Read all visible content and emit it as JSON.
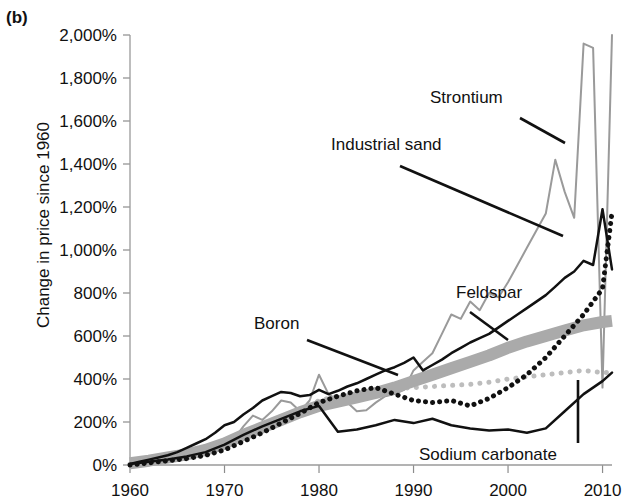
{
  "panel": {
    "label": "(b)"
  },
  "chart_data": {
    "type": "line",
    "title": "",
    "subtitle": "",
    "xlabel": "",
    "ylabel": "Change in price since 1960",
    "xlim": [
      1960,
      2011
    ],
    "ylim": [
      0,
      2000
    ],
    "xticks": [
      1960,
      1970,
      1980,
      1990,
      2000,
      2010
    ],
    "xtick_labels": [
      "1960",
      "1970",
      "1980",
      "1990",
      "2000",
      "2010"
    ],
    "yticks": [
      0,
      200,
      400,
      600,
      800,
      1000,
      1200,
      1400,
      1600,
      1800,
      2000
    ],
    "ytick_labels": [
      "0%",
      "200%",
      "400%",
      "600%",
      "800%",
      "1,000%",
      "1,200%",
      "1,400%",
      "1,600%",
      "1,800%",
      "2,000%"
    ],
    "grid": false,
    "legend": "inline-annotations",
    "units": "percent change since 1960",
    "annotations": [
      {
        "name": "strontium-annotation",
        "text": "Strontium",
        "text_x": 430,
        "text_y": 103,
        "leader": [
          [
            520,
            118
          ],
          [
            565,
            143
          ]
        ]
      },
      {
        "name": "industrial-sand-annotation",
        "text": "Industrial sand",
        "text_x": 331,
        "text_y": 150,
        "leader": [
          [
            563,
            236
          ],
          [
            400,
            166
          ]
        ]
      },
      {
        "name": "feldspar-annotation",
        "text": "Feldspar",
        "text_x": 456,
        "text_y": 298,
        "leader": [
          [
            508,
            340
          ],
          [
            470,
            312
          ]
        ]
      },
      {
        "name": "boron-annotation",
        "text": "Boron",
        "text_x": 254,
        "text_y": 329,
        "leader": [
          [
            398,
            375
          ],
          [
            307,
            340
          ]
        ]
      },
      {
        "name": "sodium-carbonate-annotation",
        "text": "Sodium carbonate",
        "text_x": 419,
        "text_y": 460,
        "leader": [
          [
            578,
            380
          ],
          [
            578,
            443
          ]
        ]
      }
    ],
    "series": [
      {
        "name": "Strontium",
        "style": "solid",
        "color": "#9a9a9a",
        "width": 2,
        "x": [
          1960,
          1961,
          1962,
          1963,
          1964,
          1965,
          1966,
          1967,
          1968,
          1969,
          1970,
          1971,
          1972,
          1973,
          1974,
          1975,
          1976,
          1977,
          1978,
          1979,
          1980,
          1981,
          1982,
          1983,
          1984,
          1985,
          1986,
          1987,
          1988,
          1989,
          1990,
          1991,
          1992,
          1993,
          1994,
          1995,
          1996,
          1997,
          1998,
          1999,
          2000,
          2001,
          2002,
          2003,
          2004,
          2005,
          2006,
          2007,
          2008,
          2009,
          2010,
          2011
        ],
        "values": [
          0,
          10,
          15,
          20,
          25,
          30,
          35,
          45,
          55,
          70,
          85,
          120,
          180,
          230,
          210,
          250,
          300,
          290,
          250,
          300,
          420,
          330,
          300,
          290,
          250,
          255,
          290,
          320,
          330,
          350,
          440,
          480,
          520,
          610,
          700,
          680,
          760,
          720,
          800,
          780,
          850,
          930,
          1010,
          1090,
          1170,
          1420,
          1270,
          1150,
          1960,
          1940,
          360,
          2000
        ]
      },
      {
        "name": "Industrial sand",
        "style": "dotted",
        "color": "#bdbdbd",
        "width": 5,
        "x": [
          1960,
          1962,
          1964,
          1966,
          1968,
          1970,
          1972,
          1974,
          1976,
          1978,
          1980,
          1982,
          1984,
          1986,
          1988,
          1990,
          1992,
          1994,
          1996,
          1998,
          2000,
          2002,
          2004,
          2006,
          2008,
          2010,
          2011
        ],
        "values": [
          5,
          15,
          25,
          35,
          55,
          80,
          130,
          170,
          210,
          250,
          300,
          320,
          330,
          350,
          355,
          360,
          365,
          370,
          375,
          385,
          400,
          410,
          420,
          430,
          440,
          430,
          430
        ]
      },
      {
        "name": "Boron",
        "style": "thick-band",
        "color": "#aaaaaa",
        "width": 12,
        "x": [
          1960,
          1962,
          1964,
          1966,
          1968,
          1970,
          1972,
          1974,
          1976,
          1978,
          1980,
          1982,
          1984,
          1986,
          1988,
          1990,
          1992,
          1994,
          1996,
          1998,
          2000,
          2002,
          2004,
          2006,
          2008,
          2010,
          2011
        ],
        "values": [
          8,
          20,
          35,
          50,
          70,
          100,
          140,
          175,
          210,
          245,
          275,
          295,
          315,
          335,
          360,
          390,
          420,
          450,
          480,
          510,
          545,
          575,
          600,
          625,
          650,
          665,
          670
        ]
      },
      {
        "name": "Feldspar",
        "style": "solid",
        "color": "#111111",
        "width": 2.5,
        "x": [
          1960,
          1961,
          1962,
          1963,
          1964,
          1965,
          1966,
          1967,
          1968,
          1969,
          1970,
          1971,
          1972,
          1973,
          1974,
          1975,
          1976,
          1977,
          1978,
          1979,
          1980,
          1981,
          1982,
          1983,
          1984,
          1985,
          1986,
          1987,
          1988,
          1989,
          1990,
          1991,
          1992,
          1993,
          1994,
          1995,
          1996,
          1997,
          1998,
          1999,
          2000,
          2001,
          2002,
          2003,
          2004,
          2005,
          2006,
          2007,
          2008,
          2009,
          2010,
          2011
        ],
        "values": [
          5,
          15,
          25,
          35,
          45,
          60,
          80,
          100,
          120,
          150,
          185,
          200,
          235,
          265,
          300,
          320,
          340,
          335,
          320,
          325,
          350,
          330,
          345,
          365,
          380,
          400,
          420,
          440,
          455,
          475,
          500,
          440,
          465,
          490,
          520,
          545,
          570,
          590,
          610,
          640,
          670,
          700,
          730,
          760,
          790,
          830,
          870,
          900,
          950,
          930,
          1190,
          910
        ]
      },
      {
        "name": "Sodium carbonate",
        "style": "dotted-heavy",
        "color": "#111111",
        "width": 5,
        "x": [
          1960,
          1962,
          1964,
          1966,
          1968,
          1970,
          1972,
          1974,
          1976,
          1978,
          1980,
          1982,
          1984,
          1986,
          1988,
          1990,
          1992,
          1994,
          1996,
          1998,
          2000,
          2002,
          2004,
          2006,
          2008,
          2010,
          2011
        ],
        "values": [
          0,
          10,
          20,
          30,
          45,
          70,
          110,
          150,
          195,
          240,
          290,
          320,
          345,
          360,
          330,
          300,
          290,
          300,
          275,
          310,
          360,
          420,
          500,
          600,
          700,
          820,
          1175
        ]
      },
      {
        "name": "Sodium carbonate lower",
        "style": "solid-thin",
        "color": "#111111",
        "width": 2.5,
        "x": [
          1960,
          1962,
          1964,
          1966,
          1968,
          1970,
          1972,
          1974,
          1976,
          1978,
          1980,
          1982,
          1984,
          1986,
          1988,
          1990,
          1992,
          1994,
          1996,
          1998,
          2000,
          2002,
          2004,
          2006,
          2008,
          2010,
          2011
        ],
        "values": [
          5,
          15,
          25,
          40,
          60,
          95,
          140,
          180,
          215,
          250,
          275,
          155,
          165,
          185,
          210,
          195,
          215,
          185,
          170,
          160,
          165,
          150,
          170,
          250,
          330,
          390,
          430
        ]
      }
    ]
  }
}
